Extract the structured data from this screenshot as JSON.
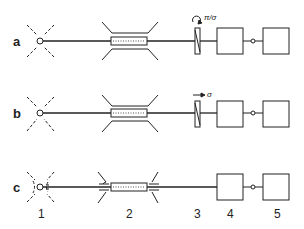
{
  "diagram": {
    "rows": [
      {
        "label": "a",
        "y": 41,
        "polarizer": "circular",
        "annotation": "π/σ",
        "source": "free"
      },
      {
        "label": "b",
        "y": 113,
        "polarizer": "linear",
        "annotation": "σ",
        "source": "free"
      },
      {
        "label": "c",
        "y": 187,
        "polarizer": "none",
        "annotation": "",
        "source": "coupled"
      }
    ],
    "column_labels": [
      "1",
      "2",
      "3",
      "4",
      "5"
    ],
    "colors": {
      "stroke": "#222222",
      "background": "#ffffff"
    }
  }
}
